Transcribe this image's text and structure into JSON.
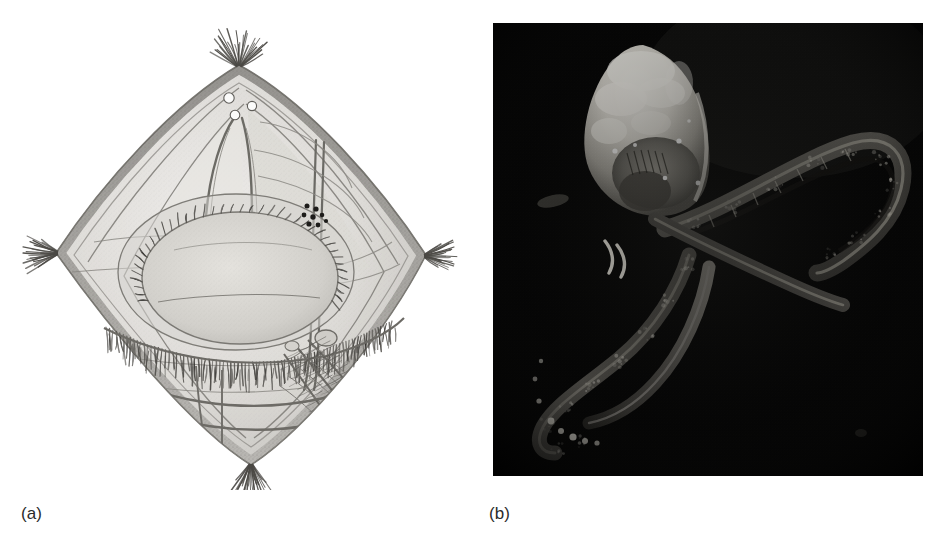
{
  "figure": {
    "background_color": "#ffffff",
    "width": 940,
    "height": 551,
    "panel_count": 2
  },
  "panels": [
    {
      "key": "a",
      "label": "(a)",
      "kind": "line-drawing",
      "description": "Grayscale stippled line drawing of a diamond-shaped planktonic crustacean in lateral/ventral view, showing the bivalved carapace, apical setae tufts, three eye spots, a large central ovoid organ with a ciliated fringe, a cluster of dark granules, and internal appendages.",
      "subject": "planktonic crustacean specimen",
      "view": "whole body, diamond outline",
      "ink_color": "#6e6e6e",
      "fill_color": "#d8d8d6",
      "features": [
        "apical seta tuft (top)",
        "eye spots",
        "lateral spine seta tuft (left)",
        "lateral spine seta tuft (right)",
        "central ovoid organ",
        "ciliated fringe band",
        "dark granule cluster",
        "caudal seta tuft (bottom)",
        "internal appendage strands"
      ]
    },
    {
      "key": "b",
      "label": "(b)",
      "kind": "photomicrograph",
      "description": "Dark-field photomicrograph on a black background showing a brightly illuminated ovoid carapace at upper left and two long, curved, segmented appendages sweeping to the lower left and looping to the right.",
      "subject": "same specimen, dark-field illumination",
      "background_color": "#050505",
      "highlight_color": "#f2f0ea",
      "features": [
        "bright carapace body",
        "internal dark gut/organ",
        "upper right looping appendage",
        "lower left trailing appendage",
        "bright granular terminal segments"
      ]
    }
  ],
  "drawing_geometry": {
    "apex_top": [
      231,
      55
    ],
    "apex_bottom": [
      243,
      455
    ],
    "corner_left": [
      48,
      243
    ],
    "corner_right": [
      418,
      245
    ],
    "central_oval": {
      "cx": 228,
      "cy": 262,
      "rx": 118,
      "ry": 78
    },
    "granule_cluster": {
      "cx": 305,
      "cy": 205,
      "count": 8
    },
    "eye_spots": [
      [
        222,
        88
      ],
      [
        243,
        95
      ],
      [
        228,
        104
      ]
    ]
  },
  "photo_geometry": {
    "frame": [
      23,
      23,
      430,
      453
    ],
    "carapace": {
      "cx": 150,
      "cy": 105,
      "rx": 62,
      "ry": 85
    },
    "appendage_loop_right": "sweeps from centre to the right edge and curls back",
    "appendage_trail_left": "sweeps from centre down and to the lower left corner"
  }
}
